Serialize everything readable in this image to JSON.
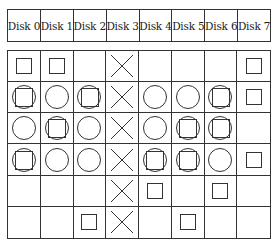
{
  "headers": [
    "Disk 0",
    "Disk 1",
    "Disk 2",
    "Disk 3",
    "Disk 4",
    "Disk 5",
    "Disk 6",
    "Disk 7"
  ],
  "legend": {
    "empty": "",
    "S": "square",
    "C": "circle",
    "CS": "circle-with-square",
    "X": "cross"
  },
  "rows": [
    [
      "S",
      "S",
      "",
      "X",
      "",
      "",
      "",
      "S"
    ],
    [
      "CS",
      "C",
      "CS",
      "X",
      "C",
      "C",
      "CS",
      "S"
    ],
    [
      "C",
      "CS",
      "C",
      "X",
      "C",
      "CS",
      "CS",
      ""
    ],
    [
      "CS",
      "C",
      "C",
      "X",
      "CS",
      "CS",
      "C",
      "S"
    ],
    [
      "",
      "",
      "",
      "X",
      "S",
      "",
      "S",
      ""
    ],
    [
      "",
      "",
      "S",
      "X",
      "",
      "S",
      "",
      ""
    ]
  ],
  "colors": {
    "line": "#333333",
    "background": "#ffffff"
  }
}
